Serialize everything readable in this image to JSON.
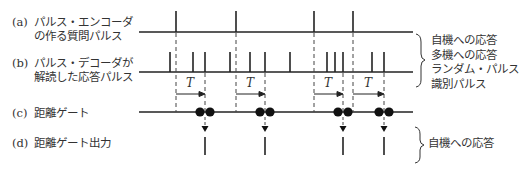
{
  "labels": {
    "a": {
      "tag": "(a)",
      "line1": "パルス・エンコーダ",
      "line2": "の作る質問パルス"
    },
    "b": {
      "tag": "(b)",
      "line1": "パルス・デコーダが",
      "line2": "解読した応答パルス"
    },
    "c": {
      "tag": "(c)",
      "line1": "距離ゲート"
    },
    "d": {
      "tag": "(d)",
      "line1": "距離ゲート出力"
    }
  },
  "legend_b": [
    "自機への応答",
    "多機への応答",
    "ランダム・パルス",
    "識別パルス"
  ],
  "legend_d": [
    "自機への応答"
  ],
  "interval_label": "T",
  "timing": {
    "a_pulses_x": [
      176,
      236,
      314,
      353
    ],
    "b_pulses_x": [
      170,
      193,
      205,
      230,
      250,
      265,
      290,
      327,
      335,
      343,
      372,
      384
    ],
    "gate_outputs_x": [
      205,
      265,
      343,
      384
    ]
  }
}
